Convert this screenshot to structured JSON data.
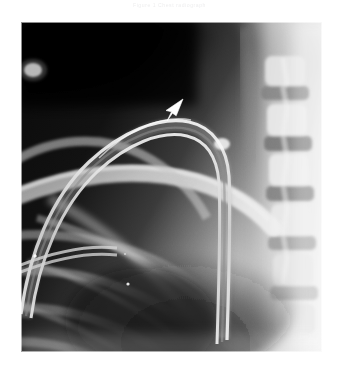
{
  "page": {
    "background_color": "#ffffff",
    "width": 339,
    "height": 373
  },
  "caption": {
    "text": "Figure 1  Chest radiograph",
    "color": "#ececed",
    "position": "top-center"
  },
  "radiograph": {
    "modality": "X-ray",
    "body_region": "Chest — right apex / upper thorax",
    "projection": "Frontal (AP)",
    "frame": {
      "left": 21,
      "top": 22,
      "width": 301,
      "height": 330
    },
    "tone": {
      "lung_dark": "#101010",
      "apex_black": "#080808",
      "soft_tissue_mid": "#9a9a9a",
      "bone_light": "#dedede",
      "neck_bright": "#f3f3f3",
      "border_edge": "#ffffff"
    },
    "features": [
      {
        "name": "lung-apex-field",
        "label": "Right lung apex (radiolucent)",
        "tone": "#0b0b0b"
      },
      {
        "name": "catheter-tube",
        "label": "Radiopaque catheter / tube looping over the apex",
        "tone": "#d8d8d8"
      },
      {
        "name": "clavicle",
        "label": "Clavicle",
        "tone": "#cfcfcf"
      },
      {
        "name": "rib-cage",
        "label": "Posterior and anterior ribs",
        "tone": "#b4b4b4"
      },
      {
        "name": "thoracic-spine",
        "label": "Thoracic vertebral bodies and disc spaces",
        "tone": "#c7c7c7"
      },
      {
        "name": "scapula-edge",
        "label": "Scapular border",
        "tone": "#c0c0c0"
      },
      {
        "name": "soft-tissue-neck",
        "label": "Supraclavicular soft tissue / neck",
        "tone": "#efefef"
      },
      {
        "name": "radiopaque-marker-dot",
        "label": "Small bright radiopaque marker",
        "tone": "#ffffff"
      }
    ]
  },
  "annotation": {
    "arrow": {
      "name": "arrowhead-marker",
      "color": "#ffffff",
      "direction": "up-right",
      "points_to": "Apex of the catheter loop",
      "x": 139,
      "y": 76
    }
  }
}
